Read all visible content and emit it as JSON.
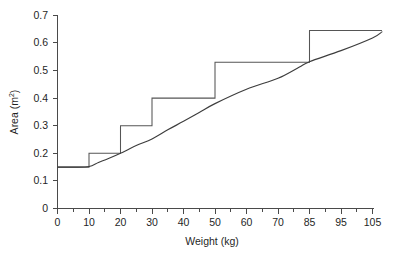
{
  "chart_data": {
    "type": "line",
    "title": "",
    "xlabel": "Weight (kg)",
    "ylabel": "Area (m2)",
    "ylabel_base": "Area (m",
    "ylabel_sup": "2",
    "ylabel_close": ")",
    "grid": false,
    "legend": "none",
    "xlim": [
      0,
      110
    ],
    "ylim": [
      0,
      0.7
    ],
    "x_tick_labels": [
      "0",
      "10",
      "20",
      "30",
      "40",
      "50",
      "60",
      "70",
      "85",
      "95",
      "105"
    ],
    "x_tick_values": [
      0,
      10,
      20,
      30,
      40,
      50,
      60,
      70,
      85,
      95,
      105
    ],
    "x_minor_ticks_between": 1,
    "y_tick_labels": [
      "0",
      "0.1",
      "0.2",
      "0.3",
      "0.4",
      "0.5",
      "0.6",
      "0.7"
    ],
    "y_tick_values": [
      0,
      0.1,
      0.2,
      0.3,
      0.4,
      0.5,
      0.6,
      0.7
    ],
    "series": [
      {
        "name": "step-banding",
        "style": "step",
        "breakpoints_kg": [
          0,
          10,
          20,
          30,
          50,
          85,
          108
        ],
        "levels_m2": [
          0.15,
          0.2,
          0.3,
          0.4,
          0.53,
          0.645
        ],
        "points": [
          {
            "x": 0,
            "y": 0.15
          },
          {
            "x": 10,
            "y": 0.15
          },
          {
            "x": 10,
            "y": 0.2
          },
          {
            "x": 20,
            "y": 0.2
          },
          {
            "x": 20,
            "y": 0.3
          },
          {
            "x": 30,
            "y": 0.3
          },
          {
            "x": 30,
            "y": 0.4
          },
          {
            "x": 50,
            "y": 0.4
          },
          {
            "x": 50,
            "y": 0.53
          },
          {
            "x": 85,
            "y": 0.53
          },
          {
            "x": 85,
            "y": 0.645
          },
          {
            "x": 108,
            "y": 0.645
          }
        ]
      },
      {
        "name": "continuous-formula",
        "style": "curve",
        "points": [
          {
            "x": 0,
            "y": 0.15
          },
          {
            "x": 5,
            "y": 0.15
          },
          {
            "x": 10,
            "y": 0.152
          },
          {
            "x": 13,
            "y": 0.167
          },
          {
            "x": 16,
            "y": 0.18
          },
          {
            "x": 20,
            "y": 0.2
          },
          {
            "x": 25,
            "y": 0.228
          },
          {
            "x": 30,
            "y": 0.252
          },
          {
            "x": 35,
            "y": 0.285
          },
          {
            "x": 40,
            "y": 0.316
          },
          {
            "x": 45,
            "y": 0.348
          },
          {
            "x": 50,
            "y": 0.38
          },
          {
            "x": 60,
            "y": 0.432
          },
          {
            "x": 70,
            "y": 0.472
          },
          {
            "x": 80,
            "y": 0.512
          },
          {
            "x": 85,
            "y": 0.532
          },
          {
            "x": 95,
            "y": 0.572
          },
          {
            "x": 105,
            "y": 0.618
          },
          {
            "x": 108,
            "y": 0.64
          }
        ]
      }
    ]
  },
  "colors": {
    "axis": "#4a4a4a",
    "step_series": "#555555",
    "curve_series": "#3d3d3d",
    "background": "#ffffff",
    "text": "#1f1f1f"
  }
}
